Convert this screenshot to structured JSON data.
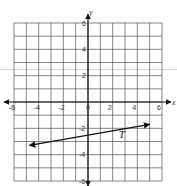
{
  "chart_data": {
    "type": "line",
    "title": "",
    "xlabel": "x",
    "ylabel": "y",
    "xlim": [
      -6,
      6
    ],
    "ylim": [
      -6,
      6
    ],
    "grid": true,
    "x_tick_labels": [
      "-6",
      "-4",
      "-2",
      "0",
      "2",
      "4",
      "6"
    ],
    "y_tick_labels": [
      "6",
      "4",
      "2",
      "-2",
      "-4",
      "-6"
    ],
    "series": [
      {
        "name": "T",
        "points": [
          [
            -4.75,
            -3.3
          ],
          [
            5.0,
            -1.7
          ]
        ],
        "arrows": "both",
        "y_intercept": -2.5,
        "slope_approx": 0.167
      }
    ],
    "annotations": [
      {
        "text": "T",
        "x": 2.5,
        "y": -2.7
      }
    ]
  },
  "colors": {
    "grid": "#555555",
    "axis": "#111111",
    "line": "#111111",
    "background": "#ffffff"
  }
}
